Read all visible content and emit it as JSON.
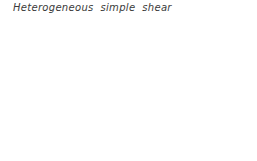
{
  "figure": {
    "title_words": [
      "Heterogeneous",
      "simple",
      "shear"
    ],
    "caption_style": "italic",
    "line_color": "#555555",
    "background_color": "#ffffff",
    "text_color": "#3a3a3a"
  },
  "chart_data": {
    "type": "diagram",
    "grid": true,
    "shear_profile": {
      "xlabel": "horizontal displacement (px)",
      "ylabel": "row index from bottom",
      "row_index": [
        0,
        1,
        2,
        3,
        4,
        5,
        6,
        7
      ],
      "displacement": [
        0,
        3,
        13,
        36,
        62,
        85,
        94,
        97
      ],
      "max_displacement": 97,
      "shear_type": "heterogeneous",
      "strain_zero_at": [
        "top",
        "bottom"
      ],
      "strain_max_at": "middle"
    },
    "row_y": [
      147,
      129,
      111,
      93,
      75,
      57,
      39,
      21
    ],
    "legend": "none"
  }
}
